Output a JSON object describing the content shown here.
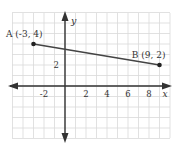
{
  "chart_data": {
    "type": "line",
    "title": "",
    "xlabel": "x",
    "ylabel": "y",
    "xlim": [
      -4,
      10
    ],
    "ylim": [
      -5,
      7
    ],
    "grid": true,
    "x_ticks": [
      -2,
      2,
      4,
      6,
      8
    ],
    "x_tick_labels": [
      "-2",
      "2",
      "4",
      "6",
      "8"
    ],
    "y_ticks": [
      2
    ],
    "y_tick_labels": [
      "2"
    ],
    "series": [
      {
        "name": "segment AB",
        "points": [
          {
            "label": "A (-3, 4)",
            "x": -3,
            "y": 4
          },
          {
            "label": "B (9, 2)",
            "x": 9,
            "y": 2
          }
        ]
      }
    ],
    "annotations": [
      {
        "text": "A (-3, 4)",
        "x": -3,
        "y": 4
      },
      {
        "text": "B (9, 2)",
        "x": 9,
        "y": 2
      }
    ]
  },
  "colors": {
    "grid": "#d9d9d9",
    "axis": "#333333",
    "line": "#444444",
    "point": "#222222"
  }
}
